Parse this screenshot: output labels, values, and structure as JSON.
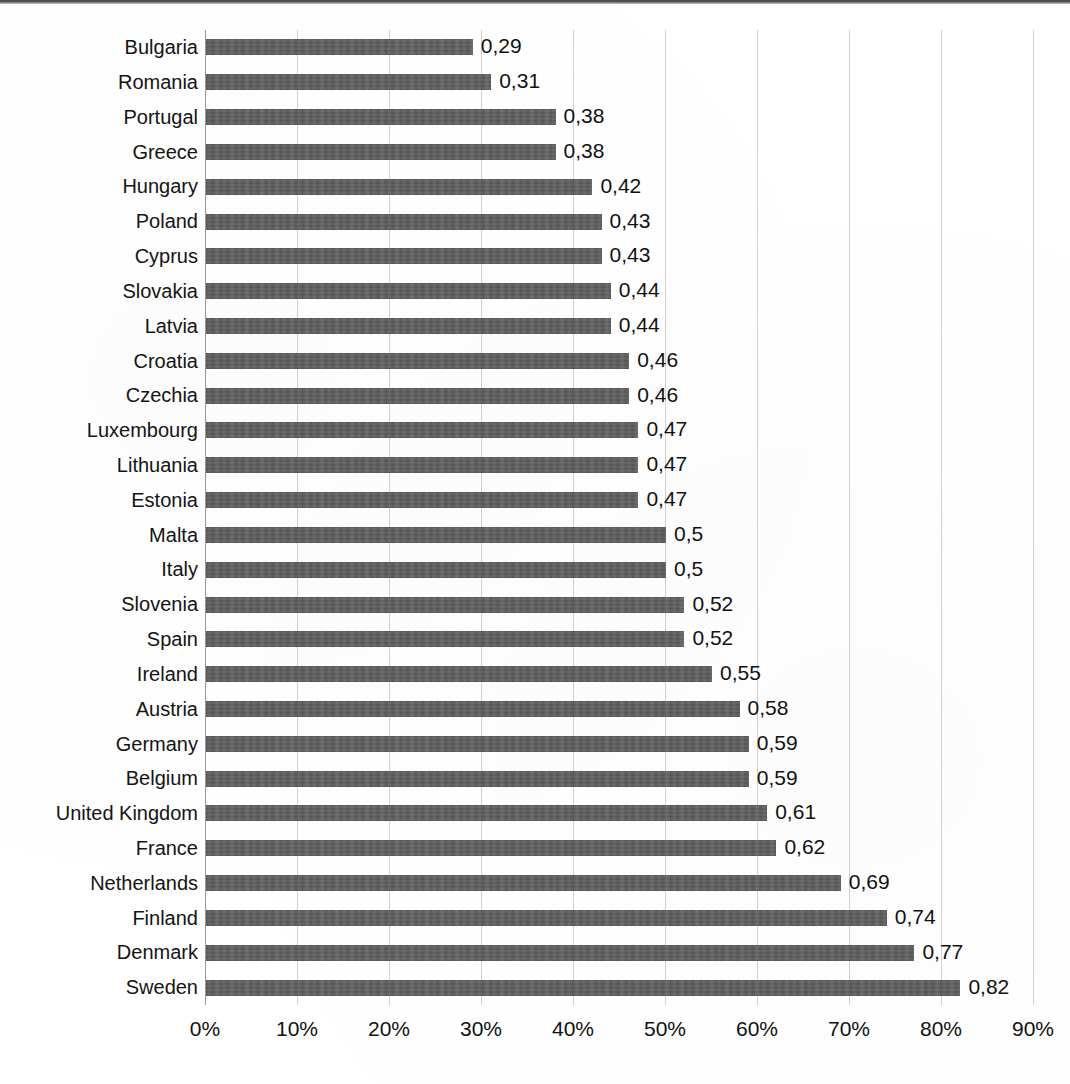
{
  "chart_data": {
    "type": "bar",
    "orientation": "horizontal",
    "title": "",
    "subtitle": "",
    "xlabel": "",
    "ylabel": "",
    "xlim": [
      0,
      0.9
    ],
    "grid": true,
    "legend": null,
    "value_label_format": "comma-decimal",
    "categories": [
      "Bulgaria",
      "Romania",
      "Portugal",
      "Greece",
      "Hungary",
      "Poland",
      "Cyprus",
      "Slovakia",
      "Latvia",
      "Croatia",
      "Czechia",
      "Luxembourg",
      "Lithuania",
      "Estonia",
      "Malta",
      "Italy",
      "Slovenia",
      "Spain",
      "Ireland",
      "Austria",
      "Germany",
      "Belgium",
      "United Kingdom",
      "France",
      "Netherlands",
      "Finland",
      "Denmark",
      "Sweden"
    ],
    "values": [
      0.29,
      0.31,
      0.38,
      0.38,
      0.42,
      0.43,
      0.43,
      0.44,
      0.44,
      0.46,
      0.46,
      0.47,
      0.47,
      0.47,
      0.5,
      0.5,
      0.52,
      0.52,
      0.55,
      0.58,
      0.59,
      0.59,
      0.61,
      0.62,
      0.69,
      0.74,
      0.77,
      0.82
    ],
    "data_labels": [
      "0,29",
      "0,31",
      "0,38",
      "0,38",
      "0,42",
      "0,43",
      "0,43",
      "0,44",
      "0,44",
      "0,46",
      "0,46",
      "0,47",
      "0,47",
      "0,47",
      "0,5",
      "0,5",
      "0,52",
      "0,52",
      "0,55",
      "0,58",
      "0,59",
      "0,59",
      "0,61",
      "0,62",
      "0,69",
      "0,74",
      "0,77",
      "0,82"
    ],
    "xticks": [
      0,
      0.1,
      0.2,
      0.3,
      0.4,
      0.5,
      0.6,
      0.7,
      0.8,
      0.9
    ],
    "xtick_labels": [
      "0%",
      "10%",
      "20%",
      "30%",
      "40%",
      "50%",
      "60%",
      "70%",
      "80%",
      "90%"
    ],
    "colors": {
      "bar": "#585858",
      "gridline": "#d2d2d2",
      "axis": "#9a9a9a",
      "text": "#111111",
      "background": "#ffffff"
    }
  }
}
